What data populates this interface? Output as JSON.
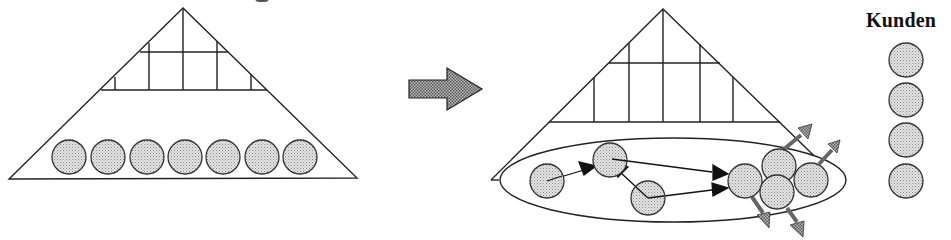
{
  "diagram": {
    "title_fragment": "",
    "colors": {
      "stroke": "#222222",
      "circle_fill": "#d6d6d6",
      "arrow_fill": "#9a9a9a",
      "background": "#ffffff"
    },
    "left_pyramid": {
      "label": "hierarchical organization",
      "apex": [
        183,
        8
      ],
      "base_left": [
        9,
        179
      ],
      "base_right": [
        357,
        178
      ],
      "grid_rows_y": [
        52,
        90
      ],
      "circles": {
        "count": 7,
        "cy": 157,
        "r": 17,
        "cx": [
          69,
          108,
          147,
          185,
          223,
          262,
          300
        ]
      }
    },
    "transition_arrow": {
      "direction": "right",
      "x": [
        409,
        482
      ],
      "y": 89
    },
    "right_pyramid": {
      "label": "process-oriented organization",
      "apex": [
        663,
        9
      ],
      "base_left": [
        491,
        180
      ],
      "base_right": [
        839,
        180
      ],
      "grid_rows_y": [
        63,
        122
      ],
      "ellipse": {
        "cx": 673,
        "cy": 180,
        "rx": 173,
        "ry": 42
      },
      "circles": [
        {
          "id": "A",
          "cx": 547,
          "cy": 181,
          "r": 17
        },
        {
          "id": "B",
          "cx": 610,
          "cy": 160,
          "r": 17
        },
        {
          "id": "C",
          "cx": 648,
          "cy": 198,
          "r": 17
        },
        {
          "id": "D",
          "cx": 745,
          "cy": 181,
          "r": 17
        },
        {
          "id": "E",
          "cx": 779,
          "cy": 166,
          "r": 17
        },
        {
          "id": "F",
          "cx": 777,
          "cy": 192,
          "r": 17
        },
        {
          "id": "G",
          "cx": 811,
          "cy": 180,
          "r": 17
        }
      ],
      "flow_arrows": [
        {
          "from": "A",
          "to": "B"
        },
        {
          "from": "C",
          "to": "B"
        },
        {
          "from": "B",
          "to": "D"
        },
        {
          "from": "C",
          "to": "D"
        }
      ],
      "outgoing_arrows": 4
    },
    "customers": {
      "label": "Kunden",
      "count": 4,
      "cx": 906,
      "cy": [
        60,
        100,
        140,
        181
      ],
      "r": 17
    }
  }
}
